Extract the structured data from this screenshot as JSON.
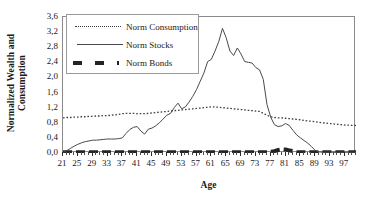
{
  "chart_data": {
    "type": "line",
    "title": "",
    "xlabel": "Age",
    "ylabel": "Normalized Wealth and Consumption",
    "ylabel_line1": "Normalized Wealth and",
    "ylabel_line2": "Consumption",
    "xlim": [
      21,
      100
    ],
    "ylim": [
      0.0,
      3.6
    ],
    "ytick_labels": [
      "0,0",
      "0,4",
      "0,8",
      "1,2",
      "1,6",
      "2,0",
      "2,4",
      "2,8",
      "3,2",
      "3,6"
    ],
    "ytick_values": [
      0.0,
      0.4,
      0.8,
      1.2,
      1.6,
      2.0,
      2.4,
      2.8,
      3.2,
      3.6
    ],
    "xtick_labels": [
      "21",
      "25",
      "29",
      "33",
      "37",
      "41",
      "45",
      "49",
      "53",
      "57",
      "61",
      "65",
      "69",
      "73",
      "77",
      "81",
      "85",
      "89",
      "93",
      "97"
    ],
    "xtick_values": [
      21,
      25,
      29,
      33,
      37,
      41,
      45,
      49,
      53,
      57,
      61,
      65,
      69,
      73,
      77,
      81,
      85,
      89,
      93,
      97
    ],
    "minor_tick_step": 1,
    "grid": false,
    "legend_position": "top-left",
    "x": [
      21,
      22,
      23,
      24,
      25,
      26,
      27,
      28,
      29,
      30,
      31,
      32,
      33,
      34,
      35,
      36,
      37,
      38,
      39,
      40,
      41,
      42,
      43,
      44,
      45,
      46,
      47,
      48,
      49,
      50,
      51,
      52,
      53,
      54,
      55,
      56,
      57,
      58,
      59,
      60,
      61,
      62,
      63,
      64,
      65,
      66,
      67,
      68,
      69,
      70,
      71,
      72,
      73,
      74,
      75,
      76,
      77,
      78,
      79,
      80,
      81,
      82,
      83,
      84,
      85,
      86,
      87,
      88,
      89,
      90,
      91,
      92,
      93,
      94,
      95,
      96,
      97,
      98,
      99,
      100
    ],
    "series": [
      {
        "name": "Norm Consumption",
        "style": "dotted",
        "color": "#3c3c3c",
        "values": [
          0.93,
          0.94,
          0.94,
          0.95,
          0.95,
          0.96,
          0.96,
          0.97,
          0.97,
          0.98,
          0.98,
          0.99,
          0.99,
          1.0,
          1.01,
          1.02,
          1.04,
          1.05,
          1.05,
          1.05,
          1.04,
          1.04,
          1.04,
          1.05,
          1.06,
          1.07,
          1.08,
          1.09,
          1.1,
          1.11,
          1.12,
          1.13,
          1.14,
          1.15,
          1.16,
          1.17,
          1.18,
          1.19,
          1.2,
          1.21,
          1.22,
          1.22,
          1.21,
          1.2,
          1.19,
          1.18,
          1.17,
          1.16,
          1.15,
          1.14,
          1.13,
          1.12,
          1.11,
          1.1,
          1.05,
          1.0,
          0.96,
          0.94,
          0.93,
          0.93,
          0.92,
          0.91,
          0.9,
          0.89,
          0.88,
          0.86,
          0.85,
          0.84,
          0.83,
          0.81,
          0.8,
          0.79,
          0.78,
          0.77,
          0.76,
          0.75,
          0.74,
          0.74,
          0.73,
          0.73
        ]
      },
      {
        "name": "Norm Stocks",
        "style": "solid",
        "color": "#4a4a4a",
        "values": [
          0.01,
          0.06,
          0.12,
          0.18,
          0.23,
          0.27,
          0.3,
          0.32,
          0.34,
          0.34,
          0.35,
          0.36,
          0.37,
          0.37,
          0.37,
          0.38,
          0.4,
          0.52,
          0.62,
          0.68,
          0.7,
          0.58,
          0.5,
          0.63,
          0.66,
          0.72,
          0.8,
          0.9,
          1.0,
          1.05,
          1.2,
          1.32,
          1.17,
          1.22,
          1.35,
          1.5,
          1.68,
          1.9,
          2.12,
          2.42,
          2.48,
          2.7,
          2.95,
          3.3,
          3.05,
          2.7,
          2.58,
          2.78,
          2.62,
          2.42,
          2.4,
          2.38,
          2.26,
          2.2,
          1.95,
          1.28,
          0.95,
          0.75,
          0.7,
          0.72,
          0.78,
          0.73,
          0.6,
          0.48,
          0.4,
          0.33,
          0.26,
          0.17,
          0.07,
          0.03,
          0.02,
          0.02,
          0.02,
          0.02,
          0.02,
          0.02,
          0.02,
          0.02,
          0.02,
          0.02
        ]
      },
      {
        "name": "Norm Bonds",
        "style": "thick-dash",
        "color": "#242424",
        "values": [
          0.02,
          0.02,
          0.02,
          0.02,
          0.02,
          0.02,
          0.02,
          0.02,
          0.02,
          0.02,
          0.02,
          0.02,
          0.02,
          0.02,
          0.02,
          0.02,
          0.02,
          0.02,
          0.02,
          0.02,
          0.02,
          0.02,
          0.02,
          0.02,
          0.02,
          0.02,
          0.02,
          0.02,
          0.02,
          0.02,
          0.02,
          0.02,
          0.02,
          0.02,
          0.02,
          0.02,
          0.02,
          0.02,
          0.02,
          0.02,
          0.02,
          0.02,
          0.02,
          0.02,
          0.02,
          0.02,
          0.02,
          0.02,
          0.02,
          0.02,
          0.02,
          0.02,
          0.02,
          0.02,
          0.02,
          0.02,
          0.03,
          0.05,
          0.08,
          0.1,
          0.09,
          0.07,
          0.05,
          0.03,
          0.02,
          0.02,
          0.02,
          0.02,
          0.02,
          0.02,
          0.02,
          0.02,
          0.02,
          0.02,
          0.02,
          0.02,
          0.02,
          0.02,
          0.02,
          0.02
        ]
      }
    ]
  },
  "legend": {
    "items": [
      {
        "label": "Norm Consumption",
        "sample": "dotted-line-sample"
      },
      {
        "label": "Norm Stocks",
        "sample": "solid-line-sample"
      },
      {
        "label": "Norm Bonds",
        "sample": "dashed-band-sample"
      }
    ]
  }
}
